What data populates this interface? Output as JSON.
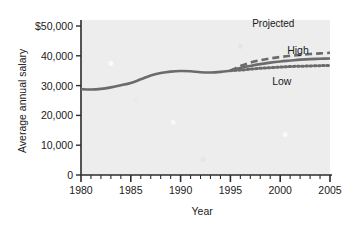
{
  "chart_data": {
    "type": "line",
    "title": "Projected",
    "xlabel": "Year",
    "ylabel": "Average annual salary",
    "xlim": [
      1980,
      2005
    ],
    "ylim": [
      0,
      50000
    ],
    "grid": false,
    "legend_position": "inline-right",
    "y_ticks": [
      {
        "value": 0,
        "label": "0"
      },
      {
        "value": 10000,
        "label": "10,000"
      },
      {
        "value": 20000,
        "label": "20,000"
      },
      {
        "value": 30000,
        "label": "30,000"
      },
      {
        "value": 40000,
        "label": "40,000"
      },
      {
        "value": 50000,
        "label": "$50,000"
      }
    ],
    "x_ticks": [
      {
        "value": 1980,
        "label": "1980"
      },
      {
        "value": 1985,
        "label": "1985"
      },
      {
        "value": 1990,
        "label": "1990"
      },
      {
        "value": 1995,
        "label": "1995"
      },
      {
        "value": 2000,
        "label": "2000"
      },
      {
        "value": 2005,
        "label": "2005"
      }
    ],
    "x_minor_tick_step": 1,
    "projection_start_year": 1995,
    "annotations": [
      {
        "text": "Projected",
        "x": 2000.5,
        "y": 52500
      },
      {
        "text": "High",
        "x": 2001.5,
        "y": 43500
      },
      {
        "text": "Low",
        "x": 2000.0,
        "y": 33200
      }
    ],
    "series": [
      {
        "name": "Historical",
        "style": "solid",
        "color": "#6b6b6b",
        "x": [
          1980,
          1981,
          1982,
          1983,
          1984,
          1985,
          1986,
          1987,
          1988,
          1989,
          1990,
          1991,
          1992,
          1993,
          1994,
          1995
        ],
        "values": [
          28800,
          28700,
          28900,
          29400,
          30100,
          30900,
          32100,
          33400,
          34200,
          34700,
          34900,
          34800,
          34500,
          34400,
          34600,
          35000
        ]
      },
      {
        "name": "High",
        "style": "dashed",
        "color": "#6b6b6b",
        "x": [
          1995,
          1996,
          1997,
          1998,
          1999,
          2000,
          2001,
          2002,
          2003,
          2004,
          2005
        ],
        "values": [
          35000,
          36600,
          37700,
          38500,
          39100,
          39600,
          40000,
          40300,
          40600,
          40800,
          41000
        ]
      },
      {
        "name": "Middle",
        "style": "solid",
        "color": "#6b6b6b",
        "x": [
          1995,
          1996,
          1997,
          1998,
          1999,
          2000,
          2001,
          2002,
          2003,
          2004,
          2005
        ],
        "values": [
          35000,
          35900,
          36600,
          37200,
          37700,
          38100,
          38400,
          38700,
          38900,
          39000,
          39100
        ]
      },
      {
        "name": "Low",
        "style": "dotted",
        "color": "#6b6b6b",
        "x": [
          1995,
          1996,
          1997,
          1998,
          1999,
          2000,
          2001,
          2002,
          2003,
          2004,
          2005
        ],
        "values": [
          35000,
          35200,
          35500,
          35800,
          36000,
          36200,
          36400,
          36500,
          36600,
          36700,
          36700
        ]
      }
    ]
  },
  "axis": {
    "y_label": "Average annual salary",
    "x_label": "Year"
  },
  "labels": {
    "projected": "Projected",
    "high": "High",
    "low": "Low"
  },
  "colors": {
    "line": "#6b6b6b",
    "axis": "#2b2b2b",
    "plot_background": "#ededed",
    "page_background": "#ffffff",
    "text": "#1a1a1a"
  }
}
